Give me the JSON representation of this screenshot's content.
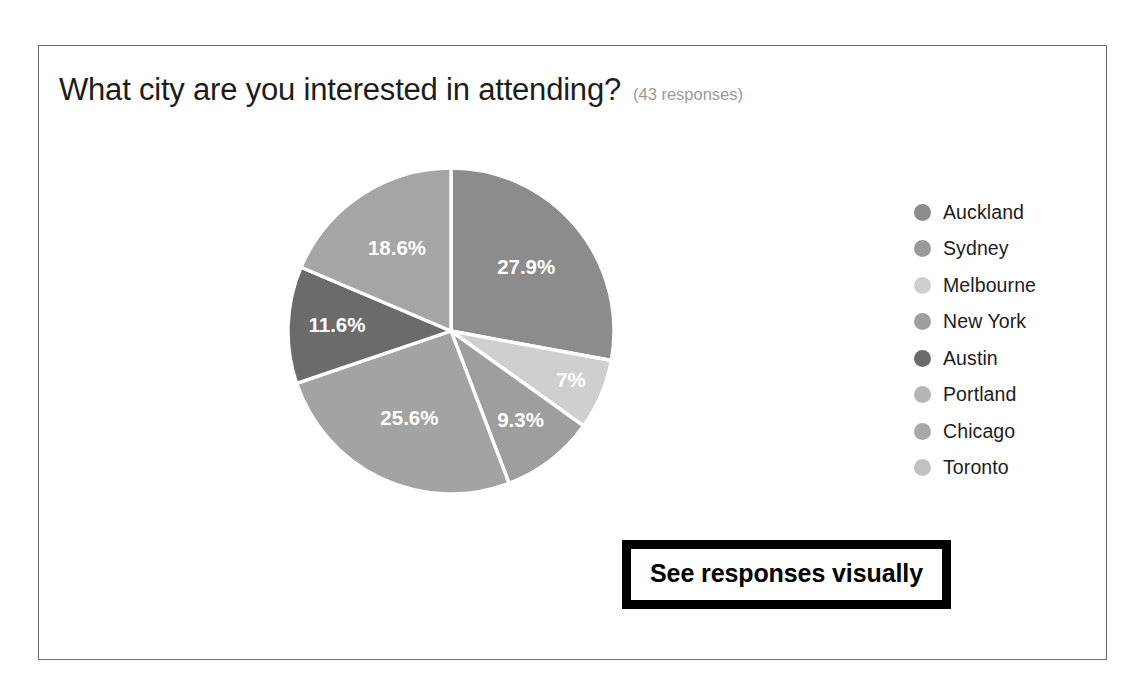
{
  "card": {
    "question_title": "What city are you interested in attending?",
    "response_count": "(43 responses)"
  },
  "annotation": {
    "label": "See responses visually"
  },
  "legend": {
    "items": [
      {
        "label": "Auckland",
        "color": "#8c8c8c"
      },
      {
        "label": "Sydney",
        "color": "#9a9a9a"
      },
      {
        "label": "Melbourne",
        "color": "#cfcfcf"
      },
      {
        "label": "New York",
        "color": "#9e9e9e"
      },
      {
        "label": "Austin",
        "color": "#6b6b6b"
      },
      {
        "label": "Portland",
        "color": "#b5b5b5"
      },
      {
        "label": "Chicago",
        "color": "#a8a8a8"
      },
      {
        "label": "Toronto",
        "color": "#c2c2c2"
      }
    ]
  },
  "chart_data": {
    "type": "pie",
    "title": "What city are you interested in attending?",
    "subtitle": "(43 responses)",
    "total_responses": 43,
    "legend_position": "right",
    "categories": [
      "Auckland",
      "Sydney",
      "Melbourne",
      "New York",
      "Austin",
      "Portland",
      "Chicago",
      "Toronto"
    ],
    "values": [
      27.9,
      7,
      9.3,
      25.6,
      11.6,
      18.6,
      0,
      0
    ],
    "labels": [
      "27.9%",
      "7%",
      "9.3%",
      "25.6%",
      "11.6%",
      "18.6%",
      "",
      ""
    ],
    "colors": [
      "#8c8c8c",
      "#cfcfcf",
      "#9e9e9e",
      "#a3a3a3",
      "#6b6b6b",
      "#a5a5a5",
      "#a8a8a8",
      "#c2c2c2"
    ],
    "slices": [
      {
        "label": "27.9%",
        "value": 27.9,
        "color": "#8c8c8c",
        "start_angle": 0,
        "end_angle": 100.44
      },
      {
        "label": "7%",
        "value": 7,
        "color": "#cfcfcf",
        "start_angle": 100.44,
        "end_angle": 125.64
      },
      {
        "label": "9.3%",
        "value": 9.3,
        "color": "#9e9e9e",
        "start_angle": 125.64,
        "end_angle": 159.12
      },
      {
        "label": "25.6%",
        "value": 25.6,
        "color": "#a3a3a3",
        "start_angle": 159.12,
        "end_angle": 251.28
      },
      {
        "label": "11.6%",
        "value": 11.6,
        "color": "#6b6b6b",
        "start_angle": 251.28,
        "end_angle": 293.04
      },
      {
        "label": "18.6%",
        "value": 18.6,
        "color": "#a5a5a5",
        "start_angle": 293.04,
        "end_angle": 360
      }
    ],
    "slice_separator_color": "#ffffff",
    "label_text_color": "#ffffff"
  }
}
